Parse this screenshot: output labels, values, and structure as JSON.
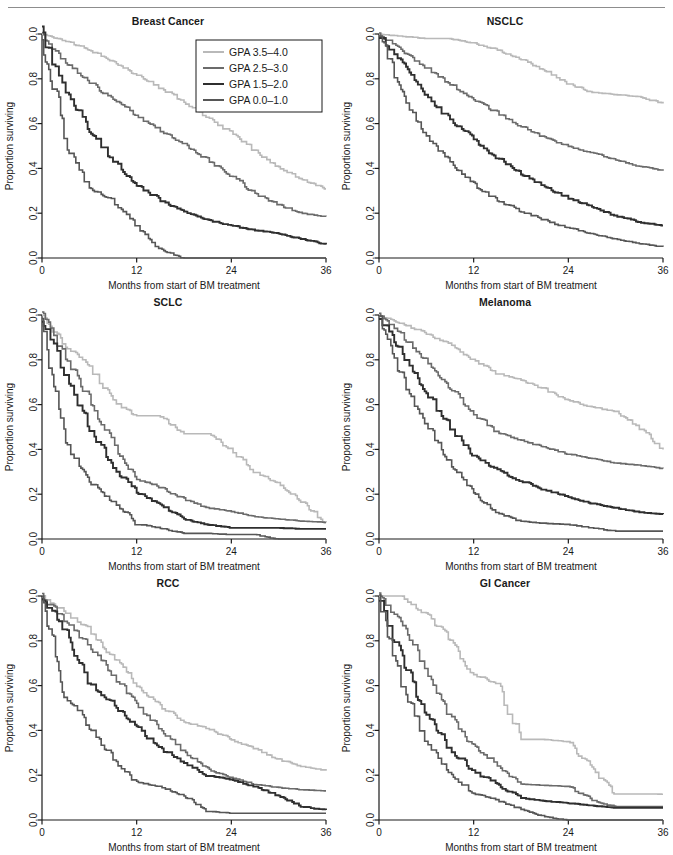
{
  "figure": {
    "axis": {
      "xlabel": "Months from start of BM treatment",
      "ylabel": "Proportion surviving",
      "xticks": [
        "0",
        "12",
        "24",
        "36"
      ],
      "xtick_values": [
        0,
        12,
        24,
        36
      ],
      "yticks": [
        "0.0",
        "0.8",
        "0.6",
        "0.4",
        "0.2",
        "0.0"
      ],
      "ytick_values": [
        1.0,
        0.8,
        0.6,
        0.4,
        0.2,
        0.0
      ],
      "xlim": [
        0,
        36
      ],
      "ylim": [
        0,
        1
      ],
      "grid": false
    },
    "legend": {
      "position": "top-right of first panel",
      "entries": [
        {
          "label": "GPA 3.5–4.0",
          "color": "#b9b9b9"
        },
        {
          "label": "GPA 2.5–3.0",
          "color": "#6b6b6b"
        },
        {
          "label": "GPA 1.5–2.0",
          "color": "#2f2f2f"
        },
        {
          "label": "GPA 0.0–1.0",
          "color": "#565656"
        }
      ]
    },
    "series_colors": [
      "#b9b9b9",
      "#6b6b6b",
      "#2f2f2f",
      "#565656"
    ]
  },
  "chart_data": [
    {
      "type": "line",
      "title": "Breast Cancer",
      "xlabel": "Months from start of BM treatment",
      "ylabel": "Proportion surviving",
      "xlim": [
        0,
        36
      ],
      "ylim": [
        0,
        1
      ],
      "x": [
        0,
        3,
        6,
        9,
        12,
        15,
        18,
        21,
        24,
        27,
        30,
        33,
        36
      ],
      "series": [
        {
          "name": "GPA 3.5–4.0",
          "values": [
            1.0,
            0.97,
            0.93,
            0.88,
            0.82,
            0.76,
            0.7,
            0.63,
            0.56,
            0.48,
            0.41,
            0.35,
            0.31
          ]
        },
        {
          "name": "GPA 2.5–3.0",
          "values": [
            1.0,
            0.88,
            0.79,
            0.71,
            0.64,
            0.57,
            0.51,
            0.44,
            0.37,
            0.29,
            0.24,
            0.2,
            0.185
          ]
        },
        {
          "name": "GPA 1.5–2.0",
          "values": [
            1.0,
            0.76,
            0.57,
            0.44,
            0.33,
            0.26,
            0.21,
            0.17,
            0.145,
            0.125,
            0.11,
            0.085,
            0.06
          ]
        },
        {
          "name": "GPA 0.0–1.0",
          "values": [
            1.0,
            0.52,
            0.31,
            0.26,
            0.15,
            0.04,
            0.0,
            0.0,
            0.0,
            0.0,
            0.0,
            0.0,
            0.0
          ]
        }
      ]
    },
    {
      "type": "line",
      "title": "NSCLC",
      "xlabel": "Months from start of BM treatment",
      "ylabel": "Proportion surviving",
      "xlim": [
        0,
        36
      ],
      "ylim": [
        0,
        1
      ],
      "x": [
        0,
        3,
        6,
        9,
        12,
        15,
        18,
        21,
        24,
        27,
        30,
        33,
        36
      ],
      "series": [
        {
          "name": "GPA 3.5–4.0",
          "values": [
            1.0,
            0.99,
            0.98,
            0.98,
            0.96,
            0.93,
            0.89,
            0.84,
            0.78,
            0.74,
            0.73,
            0.72,
            0.69
          ]
        },
        {
          "name": "GPA 2.5–3.0",
          "values": [
            1.0,
            0.93,
            0.85,
            0.78,
            0.71,
            0.65,
            0.59,
            0.54,
            0.5,
            0.47,
            0.44,
            0.41,
            0.39
          ]
        },
        {
          "name": "GPA 1.5–2.0",
          "values": [
            1.0,
            0.86,
            0.73,
            0.62,
            0.53,
            0.45,
            0.38,
            0.32,
            0.27,
            0.23,
            0.19,
            0.16,
            0.145
          ]
        },
        {
          "name": "GPA 0.0–1.0",
          "values": [
            1.0,
            0.74,
            0.55,
            0.43,
            0.33,
            0.26,
            0.21,
            0.17,
            0.135,
            0.11,
            0.085,
            0.065,
            0.05
          ]
        }
      ]
    },
    {
      "type": "line",
      "title": "SCLC",
      "xlabel": "Months from start of BM treatment",
      "ylabel": "Proportion surviving",
      "xlim": [
        0,
        36
      ],
      "ylim": [
        0,
        1
      ],
      "x": [
        0,
        3,
        6,
        9,
        12,
        15,
        18,
        21,
        24,
        27,
        30,
        33,
        36
      ],
      "series": [
        {
          "name": "GPA 3.5–4.0",
          "values": [
            1.0,
            0.86,
            0.78,
            0.62,
            0.55,
            0.55,
            0.47,
            0.47,
            0.4,
            0.3,
            0.25,
            0.17,
            0.075
          ]
        },
        {
          "name": "GPA 2.5–3.0",
          "values": [
            1.0,
            0.82,
            0.63,
            0.44,
            0.27,
            0.23,
            0.18,
            0.14,
            0.125,
            0.1,
            0.09,
            0.08,
            0.075
          ]
        },
        {
          "name": "GPA 1.5–2.0",
          "values": [
            1.0,
            0.74,
            0.5,
            0.33,
            0.21,
            0.155,
            0.09,
            0.065,
            0.05,
            0.05,
            0.05,
            0.045,
            0.045
          ]
        },
        {
          "name": "GPA 0.0–1.0",
          "values": [
            1.0,
            0.44,
            0.26,
            0.17,
            0.07,
            0.05,
            0.025,
            0.025,
            0.02,
            0.02,
            0.0,
            0.0,
            0.0
          ]
        }
      ]
    },
    {
      "type": "line",
      "title": "Melanoma",
      "xlabel": "Months from start of BM treatment",
      "ylabel": "Proportion surviving",
      "xlim": [
        0,
        36
      ],
      "ylim": [
        0,
        1
      ],
      "x": [
        0,
        3,
        6,
        9,
        12,
        15,
        18,
        21,
        24,
        27,
        30,
        33,
        36
      ],
      "series": [
        {
          "name": "GPA 3.5–4.0",
          "values": [
            1.0,
            0.96,
            0.92,
            0.87,
            0.8,
            0.74,
            0.71,
            0.67,
            0.62,
            0.59,
            0.57,
            0.5,
            0.4
          ]
        },
        {
          "name": "GPA 2.5–3.0",
          "values": [
            1.0,
            0.91,
            0.8,
            0.68,
            0.56,
            0.48,
            0.44,
            0.41,
            0.38,
            0.36,
            0.34,
            0.33,
            0.315
          ]
        },
        {
          "name": "GPA 1.5–2.0",
          "values": [
            1.0,
            0.83,
            0.66,
            0.5,
            0.38,
            0.31,
            0.26,
            0.22,
            0.19,
            0.16,
            0.14,
            0.12,
            0.11
          ]
        },
        {
          "name": "GPA 0.0–1.0",
          "values": [
            1.0,
            0.72,
            0.52,
            0.35,
            0.21,
            0.12,
            0.08,
            0.07,
            0.065,
            0.05,
            0.035,
            0.035,
            0.035
          ]
        }
      ]
    },
    {
      "type": "line",
      "title": "RCC",
      "xlabel": "Months from start of BM treatment",
      "ylabel": "Proportion surviving",
      "xlim": [
        0,
        36
      ],
      "ylim": [
        0,
        1
      ],
      "x": [
        0,
        3,
        6,
        9,
        12,
        15,
        18,
        21,
        24,
        27,
        30,
        33,
        36
      ],
      "series": [
        {
          "name": "GPA 3.5–4.0",
          "values": [
            1.0,
            0.93,
            0.85,
            0.73,
            0.61,
            0.51,
            0.44,
            0.41,
            0.36,
            0.32,
            0.27,
            0.24,
            0.22
          ]
        },
        {
          "name": "GPA 2.5–3.0",
          "values": [
            1.0,
            0.89,
            0.78,
            0.65,
            0.52,
            0.41,
            0.31,
            0.23,
            0.19,
            0.16,
            0.145,
            0.135,
            0.13
          ]
        },
        {
          "name": "GPA 1.5–2.0",
          "values": [
            1.0,
            0.84,
            0.62,
            0.52,
            0.42,
            0.32,
            0.26,
            0.2,
            0.18,
            0.15,
            0.11,
            0.06,
            0.045
          ]
        },
        {
          "name": "GPA 0.0–1.0",
          "values": [
            1.0,
            0.56,
            0.42,
            0.28,
            0.17,
            0.15,
            0.11,
            0.04,
            0.03,
            0.03,
            0.03,
            0.03,
            0.03
          ]
        }
      ]
    },
    {
      "type": "line",
      "title": "GI Cancer",
      "xlabel": "Months from start of BM treatment",
      "ylabel": "Proportion surviving",
      "xlim": [
        0,
        36
      ],
      "ylim": [
        0,
        1
      ],
      "x": [
        0,
        3,
        6,
        9,
        12,
        15,
        18,
        21,
        24,
        27,
        30,
        33,
        36
      ],
      "series": [
        {
          "name": "GPA 3.5–4.0",
          "values": [
            1.0,
            1.0,
            0.92,
            0.81,
            0.65,
            0.61,
            0.36,
            0.36,
            0.35,
            0.23,
            0.12,
            0.12,
            0.115
          ]
        },
        {
          "name": "GPA 2.5–3.0",
          "values": [
            1.0,
            0.88,
            0.68,
            0.47,
            0.33,
            0.25,
            0.16,
            0.155,
            0.15,
            0.09,
            0.06,
            0.06,
            0.06
          ]
        },
        {
          "name": "GPA 1.5–2.0",
          "values": [
            1.0,
            0.72,
            0.48,
            0.32,
            0.22,
            0.16,
            0.1,
            0.085,
            0.075,
            0.065,
            0.055,
            0.055,
            0.055
          ]
        },
        {
          "name": "GPA 0.0–1.0",
          "values": [
            1.0,
            0.6,
            0.36,
            0.21,
            0.12,
            0.09,
            0.05,
            0.015,
            0.0,
            0.0,
            0.0,
            0.0,
            0.0
          ]
        }
      ]
    }
  ]
}
